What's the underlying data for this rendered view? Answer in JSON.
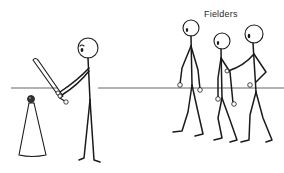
{
  "illustration": {
    "subject": "T-ball batting practice stick-figure diagram",
    "labels": {
      "fielders": "Fielders"
    },
    "elements": {
      "batter": "batter-figure",
      "tee": "batting-tee",
      "ball": "ball",
      "bat": "bat",
      "ground_line": "ground-line",
      "fielders": [
        "fielder-1",
        "fielder-2",
        "fielder-3"
      ]
    },
    "colors": {
      "background": "#ffffff",
      "line": "#1a1a1a",
      "ground": "#555555",
      "text": "#2a2a2a"
    }
  }
}
